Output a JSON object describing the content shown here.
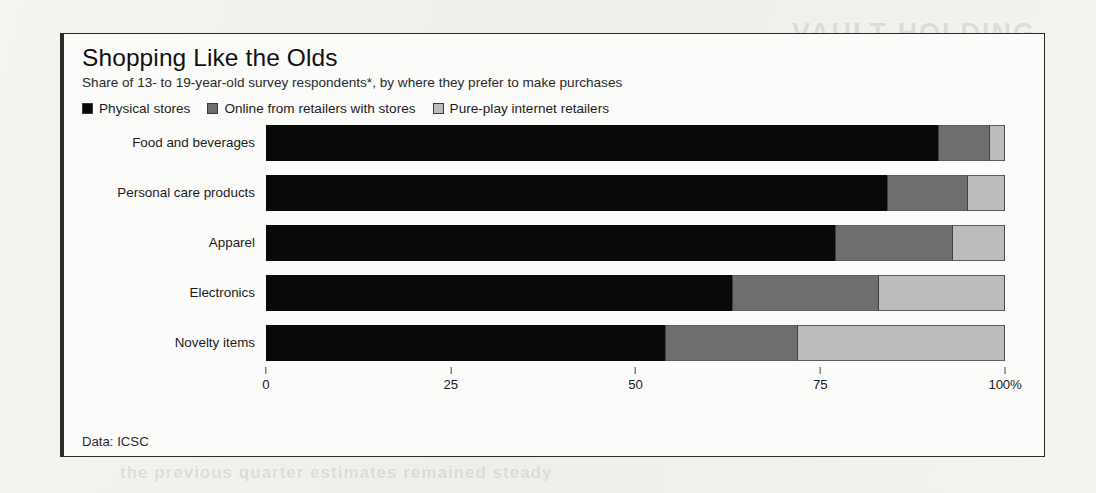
{
  "header": {
    "title": "Shopping Like the Olds",
    "subtitle": "Share of 13- to 19-year-old survey respondents*, by where they prefer to make purchases"
  },
  "footer": {
    "source": "Data: ICSC"
  },
  "page_bleed": {
    "line1": "VAULT HOLDING",
    "line2": "Industrial transit",
    "line3": "the previous quarter estimates remained steady"
  },
  "legend": {
    "items": [
      {
        "label": "Physical stores",
        "color": "#090909"
      },
      {
        "label": "Online from retailers with stores",
        "color": "#6e6e6e"
      },
      {
        "label": "Pure-play internet retailers",
        "color": "#bcbcbc"
      }
    ]
  },
  "chart_data": {
    "type": "bar",
    "orientation": "horizontal",
    "stacked": true,
    "normalized_percent": true,
    "title": "Shopping Like the Olds",
    "subtitle": "Share of 13- to 19-year-old survey respondents*, by where they prefer to make purchases",
    "xlabel": "",
    "ylabel": "",
    "xlim": [
      0,
      100
    ],
    "xticks": [
      0,
      25,
      50,
      75,
      100
    ],
    "xtick_labels": [
      "0",
      "25",
      "50",
      "75",
      "100%"
    ],
    "grid": false,
    "legend_position": "top-left",
    "categories": [
      "Food and beverages",
      "Personal care products",
      "Apparel",
      "Electronics",
      "Novelty items"
    ],
    "series": [
      {
        "name": "Physical stores",
        "color": "#090909",
        "values": [
          91,
          84,
          77,
          63,
          54
        ]
      },
      {
        "name": "Online from retailers with stores",
        "color": "#6e6e6e",
        "values": [
          7,
          11,
          16,
          20,
          18
        ]
      },
      {
        "name": "Pure-play internet retailers",
        "color": "#bcbcbc",
        "values": [
          2,
          5,
          7,
          17,
          28
        ]
      }
    ],
    "source": "Data: ICSC"
  }
}
